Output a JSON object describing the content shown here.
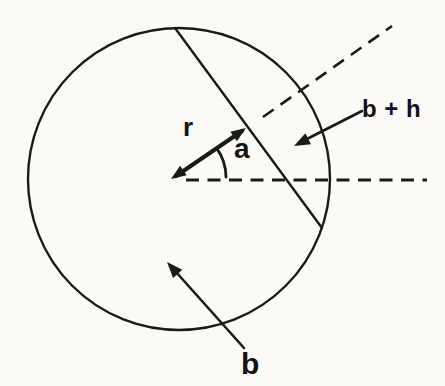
{
  "diagram": {
    "background_color": "#fbfaf7",
    "ink_color": "#1a1a1a",
    "labels": {
      "radius_vector": "r",
      "angle": "a",
      "outer_radius": "b + h",
      "circle_radius": "b"
    }
  }
}
